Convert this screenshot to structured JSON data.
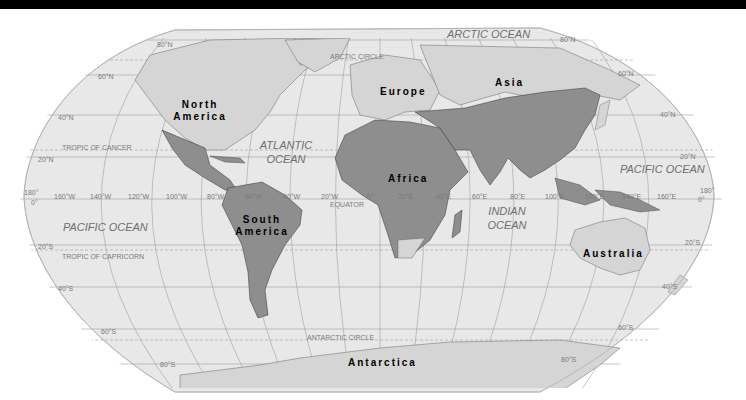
{
  "map": {
    "projection": "Robinson",
    "colors": {
      "ocean": "#e8e8e8",
      "land_light": "#d5d5d5",
      "land_dark": "#8e8e8e",
      "grid": "#9a9a9a",
      "border": "#3a3a3a",
      "background": "#ffffff",
      "top_bar": "#000000"
    },
    "continents": {
      "north_america": {
        "line1": "North",
        "line2": "America"
      },
      "south_america": {
        "line1": "South",
        "line2": "America"
      },
      "europe": "Europe",
      "asia": "Asia",
      "africa": "Africa",
      "australia": "Australia",
      "antarctica": "Antarctica"
    },
    "oceans": {
      "arctic": "ARCTIC OCEAN",
      "atlantic": {
        "line1": "ATLANTIC",
        "line2": "OCEAN"
      },
      "pacific_west": "PACIFIC OCEAN",
      "pacific_east": "PACIFIC OCEAN",
      "indian": {
        "line1": "INDIAN",
        "line2": "OCEAN"
      }
    },
    "special_lines": {
      "arctic_circle": "ARCTIC CIRCLE",
      "tropic_cancer": "TROPIC OF CANCER",
      "equator": "EQUATOR",
      "tropic_capricorn": "TROPIC OF CAPRICORN",
      "antarctic_circle": "ANTARCTIC CIRCLE"
    },
    "latitude_labels": {
      "n80": "80°N",
      "n60_w": "60°N",
      "n40_w": "40°N",
      "n20_w": "20°N",
      "zero_w": "0°",
      "s20_w": "20°S",
      "s40_w": "40°S",
      "s60_w": "60°S",
      "s80_w": "80°S",
      "n80_e": "80°N",
      "n60_e": "60°N",
      "n40_e": "40°N",
      "n20_e": "20°N",
      "zero_e": "0°",
      "s20_e": "20°S",
      "s40_e": "40°S",
      "s60_e": "60°S",
      "s80_e": "80°S"
    },
    "longitude_labels": {
      "w180": "180°",
      "w160": "160°W",
      "w140": "140°W",
      "w120": "120°W",
      "w100": "100°W",
      "w80": "80°W",
      "w60": "60°W",
      "w40": "40°W",
      "w20": "20°W",
      "zero": "0°",
      "e20": "20°E",
      "e40": "40°E",
      "e60": "60°E",
      "e80": "80°E",
      "e100": "100°E",
      "e120": "120°E",
      "e140": "140°E",
      "e160": "160°E",
      "e180": "180°"
    }
  }
}
